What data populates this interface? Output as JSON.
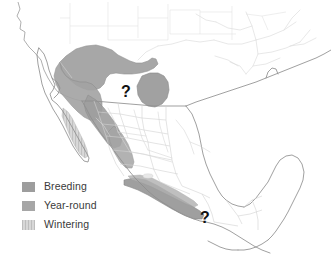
{
  "map": {
    "title": "Bird species seasonal range map of Mexico and the southwestern United States",
    "background_color": "#ffffff",
    "coastline_color": "#8c8c8c",
    "internal_border_color": "#cfcfcf",
    "river_color": "#d8d8d8",
    "regions_depicted": [
      "Southwestern United States",
      "Baja California peninsula",
      "Mexico",
      "Yucatan Peninsula",
      "Gulf of Mexico",
      "Central America (northern Guatemala and Belize)"
    ]
  },
  "legend": {
    "title": "",
    "items": [
      {
        "label": "Breeding",
        "color": "#9d9d9d",
        "pattern": "solid",
        "key": "breeding"
      },
      {
        "label": "Year-round",
        "color": "#a6a6a6",
        "pattern": "solid",
        "key": "year-round"
      },
      {
        "label": "Wintering",
        "color": "#c4c4c4",
        "pattern": "hatched",
        "key": "wintering"
      }
    ]
  },
  "annotations": [
    {
      "name": "question-mark-north",
      "text": "?",
      "note": "uncertain range, north-central Mexico",
      "x": 126,
      "y": 93
    },
    {
      "name": "question-mark-south",
      "text": "?",
      "note": "uncertain range, southern Pacific coast",
      "x": 205,
      "y": 219
    }
  ],
  "range_areas": {
    "breeding": "Sierra Madre Occidental highlands of northwestern Mexico extending into the Arizona and New Mexico border region",
    "year_round": "Isolated patch in north-central Mexico and band along the Sierra Madre del Sur in southern Mexico",
    "wintering": "Southern Baja California peninsula and western coastal lowlands"
  }
}
